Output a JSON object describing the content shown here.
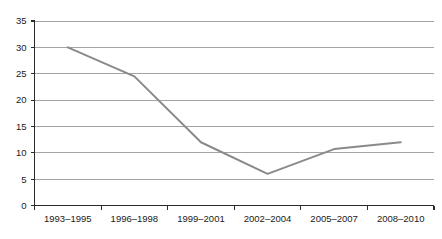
{
  "chart_data": {
    "type": "line",
    "title": "",
    "subtitle": "",
    "xlabel": "",
    "ylabel": "",
    "categories": [
      "1993–1995",
      "1996–1998",
      "1999–2001",
      "2002–2004",
      "2005–2007",
      "2008–2010"
    ],
    "series": [
      {
        "name": "",
        "values": [
          30,
          24.5,
          12,
          6,
          10.7,
          12
        ],
        "color": "#8a8a8a"
      }
    ],
    "ylim": [
      0,
      35
    ],
    "yticks": [
      0,
      5,
      10,
      15,
      20,
      25,
      30,
      35
    ],
    "ytick_labels": [
      "0",
      "5",
      "10",
      "15",
      "20",
      "25",
      "30",
      "35"
    ],
    "grid": true,
    "grid_axis": "y",
    "legend": false,
    "legend_position": "none",
    "markers": false,
    "colors": {
      "series": "#8a8a8a",
      "gridline": "#9a9a9a",
      "axis": "#2b2b2b",
      "text": "#1a1a1a",
      "background": "#ffffff"
    }
  }
}
